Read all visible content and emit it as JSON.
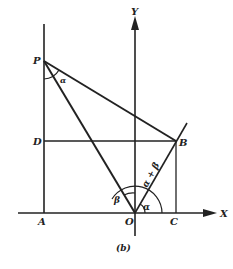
{
  "figure": {
    "caption": "(b)",
    "axes": {
      "x_label": "X",
      "y_label": "Y"
    },
    "points": {
      "P": "P",
      "D": "D",
      "A": "A",
      "O": "O",
      "B": "B",
      "C": "C"
    },
    "angles": {
      "alpha_at_P": "α",
      "beta": "β",
      "alpha": "α",
      "alpha_plus_beta": "α + β"
    }
  }
}
